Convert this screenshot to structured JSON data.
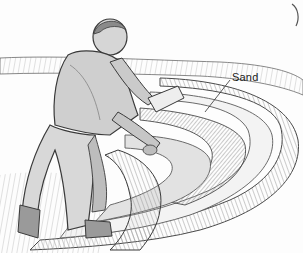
{
  "illustration": {
    "style": "pencil sketch",
    "subject": "boy kneeling and smoothing a curved sand track with a board",
    "labels": [
      {
        "text": "Sand"
      }
    ]
  },
  "colors": {
    "paper": "#fdfdfd",
    "graphite_dark": "#3a3a3a",
    "graphite_mid": "#8a8a8a",
    "graphite_light": "#c8c8c8"
  }
}
